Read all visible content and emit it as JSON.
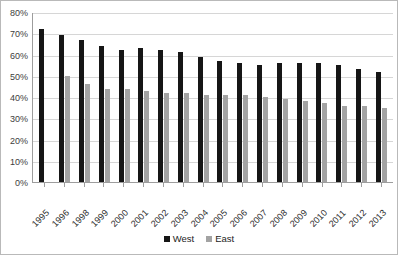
{
  "chart_data": {
    "type": "bar",
    "title": "",
    "xlabel": "",
    "ylabel": "",
    "ylim": [
      0,
      80
    ],
    "y_tick_labels": [
      "80%",
      "70%",
      "60%",
      "50%",
      "40%",
      "30%",
      "20%",
      "10%",
      "0%"
    ],
    "y_tick_values": [
      80,
      70,
      60,
      50,
      40,
      30,
      20,
      10,
      0
    ],
    "grid": true,
    "legend_position": "bottom",
    "categories": [
      "1995",
      "1996",
      "1998",
      "1999",
      "2000",
      "2001",
      "2002",
      "2003",
      "2004",
      "2005",
      "2006",
      "2007",
      "2008",
      "2009",
      "2010",
      "2011",
      "2012",
      "2013"
    ],
    "series": [
      {
        "name": "West",
        "color": "#161616",
        "values": [
          72,
          69,
          67,
          64,
          62,
          63,
          62,
          61,
          59,
          57,
          56,
          55,
          56,
          56,
          56,
          55,
          53,
          52
        ]
      },
      {
        "name": "East",
        "color": "#a3a3a3",
        "values": [
          null,
          50,
          46,
          44,
          44,
          43,
          42,
          42,
          41,
          41,
          41,
          40,
          39,
          38,
          37,
          36,
          36,
          35
        ]
      }
    ]
  },
  "legend": {
    "entries": [
      {
        "label": "West",
        "swatch": "west"
      },
      {
        "label": "East",
        "swatch": "east"
      }
    ]
  }
}
